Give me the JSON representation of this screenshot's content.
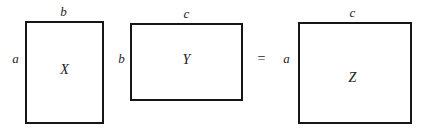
{
  "diagram": {
    "type": "matrix-multiplication-dimensions",
    "operator": "=",
    "matrices": [
      {
        "name": "X",
        "label": "X",
        "top_dimension": "b",
        "left_dimension": "a",
        "rows": "a",
        "cols": "b"
      },
      {
        "name": "Y",
        "label": "Y",
        "top_dimension": "c",
        "left_dimension": "b",
        "rows": "b",
        "cols": "c"
      },
      {
        "name": "Z",
        "label": "Z",
        "top_dimension": "c",
        "left_dimension": "a",
        "rows": "a",
        "cols": "c"
      }
    ],
    "colors": {
      "background": "#ffffff",
      "stroke": "#161616",
      "text": "#1a1a1a"
    }
  }
}
